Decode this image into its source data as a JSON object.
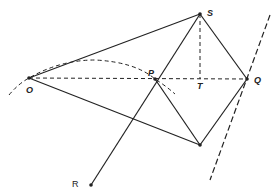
{
  "diagram": {
    "points": {
      "O": {
        "label": "O",
        "x": 29,
        "y": 78
      },
      "P": {
        "label": "P",
        "x": 155,
        "y": 79
      },
      "S": {
        "label": "S",
        "x": 200,
        "y": 14
      },
      "T": {
        "label": "T",
        "x": 200,
        "y": 79
      },
      "Q": {
        "label": "Q",
        "x": 247,
        "y": 79
      },
      "B": {
        "label": "",
        "x": 200,
        "y": 145
      },
      "R": {
        "label": "R",
        "x": 91,
        "y": 185
      }
    },
    "solid_lines": [
      "O-S",
      "O-B",
      "S-Q",
      "Q-B",
      "P-B",
      "R-S"
    ],
    "dashed_lines": [
      "O-Q",
      "S-T",
      "right-tangent-line",
      "curve-through-O-and-P"
    ],
    "colors": {
      "stroke": "#222222",
      "background": "#ffffff"
    }
  }
}
